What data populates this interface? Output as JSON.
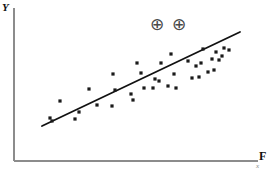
{
  "figure": {
    "background_color": "#ffffff",
    "axis_color": "#8c8c8c",
    "line_color": "#111111",
    "point_color": "#1a1a1a",
    "annotation_color": "#4a4a4a"
  },
  "axes": {
    "y_label": "Y",
    "x_label": "F",
    "x_sublabel": "x",
    "y_axis": {
      "x": 14,
      "y_top": 8,
      "y_bottom": 161
    },
    "x_axis": {
      "y": 161,
      "x_left": 14,
      "x_right": 258
    }
  },
  "annotations": [
    {
      "name": "circled-plus-1",
      "symbol": "⊕",
      "x": 148,
      "y": 15
    },
    {
      "name": "circled-plus-2",
      "symbol": "⊕",
      "x": 170,
      "y": 15
    }
  ],
  "chart_data": {
    "type": "scatter",
    "title": "",
    "xlabel": "F",
    "ylabel": "Y",
    "grid": false,
    "legend": null,
    "xlim": [
      0,
      276
    ],
    "ylim": [
      0,
      172
    ],
    "trendline": {
      "name": "regression-line",
      "x1": 42,
      "y1": 126,
      "x2": 240,
      "y2": 32,
      "stroke_width": 1.8
    },
    "point_radius": 1.6,
    "points": [
      {
        "x": 50,
        "y": 118
      },
      {
        "x": 52,
        "y": 121
      },
      {
        "x": 60,
        "y": 101
      },
      {
        "x": 75,
        "y": 119
      },
      {
        "x": 79,
        "y": 112
      },
      {
        "x": 89,
        "y": 89
      },
      {
        "x": 97,
        "y": 105
      },
      {
        "x": 112,
        "y": 106
      },
      {
        "x": 113,
        "y": 74
      },
      {
        "x": 115,
        "y": 90
      },
      {
        "x": 131,
        "y": 94
      },
      {
        "x": 133,
        "y": 100
      },
      {
        "x": 137,
        "y": 63
      },
      {
        "x": 141,
        "y": 73
      },
      {
        "x": 144,
        "y": 88
      },
      {
        "x": 153,
        "y": 88
      },
      {
        "x": 155,
        "y": 79
      },
      {
        "x": 159,
        "y": 81
      },
      {
        "x": 161,
        "y": 63
      },
      {
        "x": 168,
        "y": 86
      },
      {
        "x": 171,
        "y": 54
      },
      {
        "x": 174,
        "y": 74
      },
      {
        "x": 176,
        "y": 88
      },
      {
        "x": 188,
        "y": 61
      },
      {
        "x": 192,
        "y": 78
      },
      {
        "x": 196,
        "y": 66
      },
      {
        "x": 199,
        "y": 77
      },
      {
        "x": 201,
        "y": 63
      },
      {
        "x": 203,
        "y": 49
      },
      {
        "x": 208,
        "y": 72
      },
      {
        "x": 212,
        "y": 59
      },
      {
        "x": 214,
        "y": 70
      },
      {
        "x": 216,
        "y": 52
      },
      {
        "x": 219,
        "y": 60
      },
      {
        "x": 222,
        "y": 56
      },
      {
        "x": 224,
        "y": 48
      },
      {
        "x": 229,
        "y": 50
      }
    ]
  }
}
